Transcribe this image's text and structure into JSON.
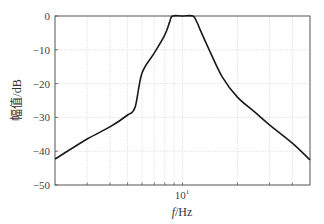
{
  "chart_data": {
    "type": "line",
    "title": "",
    "xlabel": "f/Hz",
    "ylabel": "幅值/dB",
    "xscale": "log",
    "xlim": [
      2,
      50
    ],
    "ylim": [
      -50,
      0
    ],
    "grid": true,
    "legend": null,
    "x_tick_labels": [
      {
        "value": 10,
        "label": "10¹"
      }
    ],
    "x_minor_ticks": [
      3,
      4,
      5,
      6,
      7,
      8,
      9,
      20,
      30,
      40
    ],
    "y_ticks": [
      0,
      -10,
      -20,
      -30,
      -40,
      -50
    ],
    "y_tick_labels": [
      "0",
      "−10",
      "−20",
      "−30",
      "−40",
      "−50"
    ],
    "series": [
      {
        "name": "magnitude response",
        "color": "#1a1a1a",
        "x": [
          2.0,
          3.0,
          4.0,
          5.0,
          5.5,
          6.0,
          7.0,
          8.0,
          8.5,
          8.8,
          10.0,
          11.4,
          12.0,
          12.5,
          14.0,
          16.5,
          20.0,
          25.0,
          30.0,
          40.0,
          50.0
        ],
        "y": [
          -42.3,
          -36.4,
          -32.8,
          -29.3,
          -27.0,
          -16.9,
          -11.0,
          -5.6,
          -1.8,
          0.0,
          0.0,
          0.0,
          -1.8,
          -4.1,
          -10.0,
          -18.0,
          -24.0,
          -28.5,
          -32.2,
          -37.6,
          -42.6
        ]
      }
    ]
  },
  "axes": {
    "x_label": "f/Hz",
    "y_label": "幅值/dB",
    "x_major_label": "10",
    "x_major_exp": "1"
  }
}
